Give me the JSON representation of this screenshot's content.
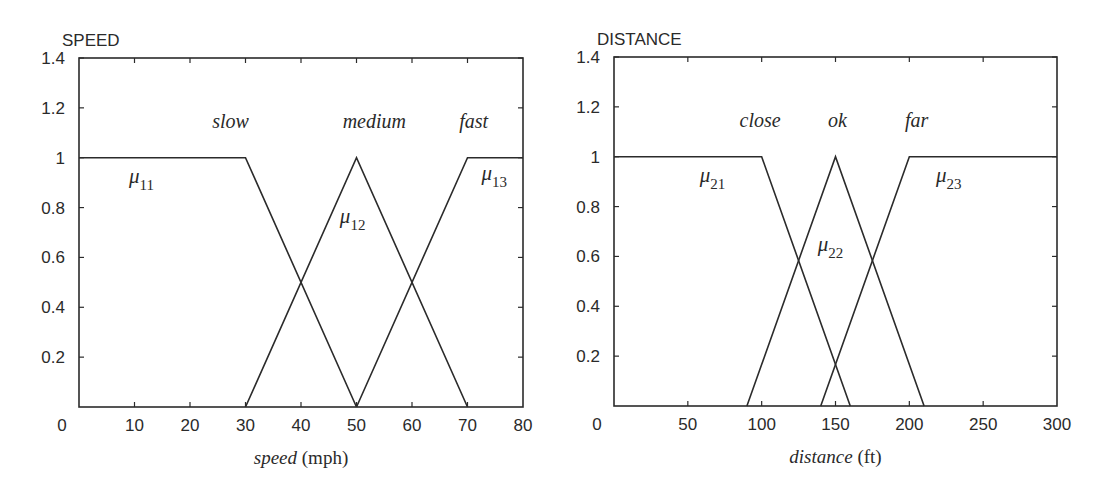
{
  "chart_data": [
    {
      "type": "line",
      "title": "SPEED",
      "xlabel": "speed",
      "xlabel_unit": "(mph)",
      "ylabel": "",
      "xlim": [
        0,
        80
      ],
      "ylim": [
        0,
        1.4
      ],
      "x_ticks": [
        0,
        10,
        20,
        30,
        40,
        50,
        60,
        70,
        80
      ],
      "x_tick_labels": [
        "0",
        "10",
        "20",
        "30",
        "40",
        "50",
        "60",
        "70",
        "80"
      ],
      "y_ticks": [
        0.2,
        0.4,
        0.6,
        0.8,
        1,
        1.2,
        1.4
      ],
      "y_tick_labels": [
        "0.2",
        "0.4",
        "0.6",
        "0.8",
        "1",
        "1.2",
        "1.4"
      ],
      "grid": false,
      "series": [
        {
          "name": "slow",
          "membership": "μ11",
          "x": [
            0,
            30,
            50
          ],
          "y": [
            1,
            1,
            0
          ],
          "label_pos": [
            24,
            1.12
          ],
          "mu_pos": [
            9,
            0.9
          ]
        },
        {
          "name": "medium",
          "membership": "μ12",
          "x": [
            30,
            50,
            70
          ],
          "y": [
            0,
            1,
            0
          ],
          "label_pos": [
            47.5,
            1.12
          ],
          "mu_pos": [
            47,
            0.74
          ]
        },
        {
          "name": "fast",
          "membership": "μ13",
          "x": [
            50,
            70,
            80
          ],
          "y": [
            0,
            1,
            1
          ],
          "label_pos": [
            68.5,
            1.12
          ],
          "mu_pos": [
            72.5,
            0.91
          ]
        }
      ]
    },
    {
      "type": "line",
      "title": "DISTANCE",
      "xlabel": "distance",
      "xlabel_unit": "(ft)",
      "ylabel": "",
      "xlim": [
        0,
        300
      ],
      "ylim": [
        0,
        1.4
      ],
      "x_ticks": [
        0,
        50,
        100,
        150,
        200,
        250,
        300
      ],
      "x_tick_labels": [
        "0",
        "50",
        "100",
        "150",
        "200",
        "250",
        "300"
      ],
      "y_ticks": [
        0.2,
        0.4,
        0.6,
        0.8,
        1,
        1.2,
        1.4
      ],
      "y_tick_labels": [
        "0.2",
        "0.4",
        "0.6",
        "0.8",
        "1",
        "1.2",
        "1.4"
      ],
      "grid": false,
      "series": [
        {
          "name": "close",
          "membership": "μ21",
          "x": [
            0,
            100,
            160
          ],
          "y": [
            1,
            1,
            0
          ],
          "label_pos": [
            85,
            1.12
          ],
          "mu_pos": [
            58,
            0.9
          ]
        },
        {
          "name": "ok",
          "membership": "μ22",
          "x": [
            90,
            150,
            210
          ],
          "y": [
            0,
            1,
            0
          ],
          "label_pos": [
            145,
            1.12
          ],
          "mu_pos": [
            138,
            0.62
          ]
        },
        {
          "name": "far",
          "membership": "μ23",
          "x": [
            140,
            200,
            300
          ],
          "y": [
            0,
            1,
            1
          ],
          "label_pos": [
            197,
            1.12
          ],
          "mu_pos": [
            218,
            0.9
          ]
        }
      ]
    }
  ]
}
